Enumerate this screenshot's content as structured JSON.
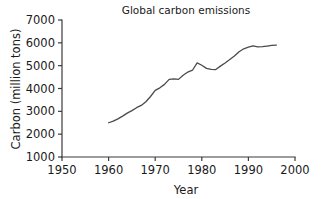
{
  "chart_data": {
    "type": "line",
    "title": "Global carbon emissions",
    "xlabel": "Year",
    "ylabel": "Carbon (million tons)",
    "xlim": [
      1950,
      2000
    ],
    "ylim": [
      1000,
      7000
    ],
    "xticks": [
      1950,
      1960,
      1970,
      1980,
      1990,
      2000
    ],
    "xtick_labels": [
      "1950",
      "1960",
      "1970",
      "1980",
      "1990",
      "2000"
    ],
    "yticks": [
      1000,
      2000,
      3000,
      4000,
      5000,
      6000,
      7000
    ],
    "ytick_labels": [
      "1000",
      "2000",
      "3000",
      "4000",
      "5000",
      "6000",
      "7000"
    ],
    "grid": false,
    "legend": false,
    "line_color": "#4a4a4a",
    "series": [
      {
        "name": "Global carbon emissions",
        "x": [
          1960,
          1961,
          1962,
          1963,
          1964,
          1965,
          1966,
          1967,
          1968,
          1969,
          1970,
          1971,
          1972,
          1973,
          1974,
          1975,
          1976,
          1977,
          1978,
          1979,
          1980,
          1981,
          1982,
          1983,
          1984,
          1985,
          1986,
          1987,
          1988,
          1989,
          1990,
          1991,
          1992,
          1993,
          1994,
          1995,
          1996
        ],
        "values": [
          2500,
          2570,
          2670,
          2790,
          2920,
          3030,
          3160,
          3260,
          3420,
          3650,
          3920,
          4030,
          4180,
          4400,
          4420,
          4400,
          4580,
          4720,
          4800,
          5120,
          5020,
          4880,
          4840,
          4830,
          4980,
          5120,
          5270,
          5420,
          5610,
          5740,
          5810,
          5870,
          5820,
          5830,
          5860,
          5890,
          5900
        ]
      }
    ]
  },
  "axes": {
    "title_text": "Global carbon emissions",
    "x_axis_title": "Year",
    "y_axis_title": "Carbon (million tons)"
  }
}
